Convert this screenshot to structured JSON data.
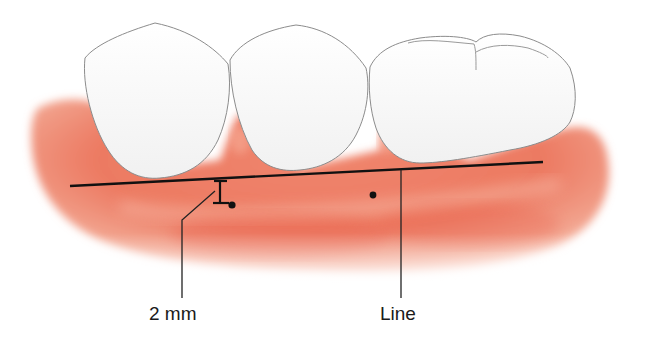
{
  "figure": {
    "labels": {
      "measurement": "2 mm",
      "line": "Line"
    },
    "colors": {
      "gum": "#e8705a",
      "gum_light": "#f4a08a",
      "tooth": "#fbfbfb",
      "tooth_outline": "#8a8a8a",
      "annotation": "#111111",
      "background": "#ffffff"
    },
    "teeth": [
      {
        "name": "tooth-1",
        "type": "premolar"
      },
      {
        "name": "tooth-2",
        "type": "premolar"
      },
      {
        "name": "tooth-3",
        "type": "molar"
      }
    ],
    "markers": [
      {
        "name": "measurement-dot",
        "x": 232,
        "y": 205
      },
      {
        "name": "reference-dot",
        "x": 373,
        "y": 195
      }
    ]
  }
}
